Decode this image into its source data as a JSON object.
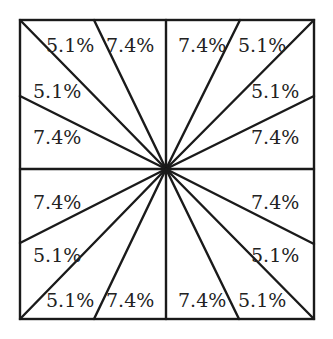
{
  "diagram": {
    "square": {
      "x0": 20,
      "y0": 20,
      "x1": 314,
      "y1": 319
    },
    "center": {
      "x": 166,
      "y": 169
    },
    "line_color": "#1a1a1a",
    "labels": [
      {
        "text": "5.1%",
        "x": 46,
        "y": 52
      },
      {
        "text": "7.4%",
        "x": 106,
        "y": 52
      },
      {
        "text": "7.4%",
        "x": 178,
        "y": 52
      },
      {
        "text": "5.1%",
        "x": 238,
        "y": 52
      },
      {
        "text": "5.1%",
        "x": 33,
        "y": 98
      },
      {
        "text": "5.1%",
        "x": 251,
        "y": 98
      },
      {
        "text": "7.4%",
        "x": 33,
        "y": 144
      },
      {
        "text": "7.4%",
        "x": 251,
        "y": 144
      },
      {
        "text": "7.4%",
        "x": 33,
        "y": 209
      },
      {
        "text": "7.4%",
        "x": 251,
        "y": 209
      },
      {
        "text": "5.1%",
        "x": 33,
        "y": 262
      },
      {
        "text": "5.1%",
        "x": 251,
        "y": 262
      },
      {
        "text": "5.1%",
        "x": 46,
        "y": 307
      },
      {
        "text": "7.4%",
        "x": 106,
        "y": 307
      },
      {
        "text": "7.4%",
        "x": 178,
        "y": 307
      },
      {
        "text": "5.1%",
        "x": 238,
        "y": 307
      }
    ]
  }
}
